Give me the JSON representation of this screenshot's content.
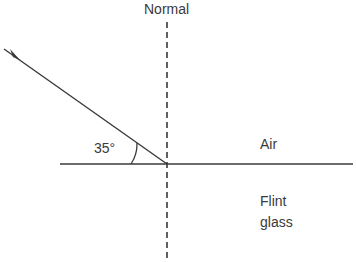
{
  "diagram": {
    "title_cropped": "",
    "normal_label": "Normal",
    "angle_label": "35°",
    "medium_top": "Air",
    "medium_bottom_line1": "Flint",
    "medium_bottom_line2": "glass",
    "incident_angle_to_surface_deg": 35,
    "colors": {
      "line": "#3a3a3a",
      "background": "#ffffff"
    }
  }
}
